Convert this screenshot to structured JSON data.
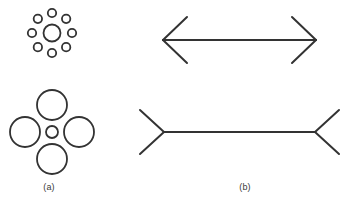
{
  "figure": {
    "width": 356,
    "height": 207,
    "background_color": "#ffffff",
    "stroke_color": "#333333",
    "caption_color": "#3a3a3a"
  },
  "panels": [
    {
      "id": "a",
      "label": "(a)",
      "illusion_name": "Ebbinghaus (Titchener circles) illusion",
      "stimuli": [
        {
          "id": "ebbinghaus-top",
          "description": "central circle surrounded by eight small circles",
          "center": {
            "x": 52,
            "y": 33
          },
          "target_circle": {
            "cx": 52,
            "cy": 33,
            "r": 8.5
          },
          "inducer_count": 8,
          "inducer_radius": 4.2,
          "inducer_ring_radius": 20,
          "inducer_start_angle_deg": -90
        },
        {
          "id": "ebbinghaus-bottom",
          "description": "central circle surrounded by four large circles",
          "center": {
            "x": 52,
            "y": 132
          },
          "target_circle": {
            "cx": 52,
            "cy": 132,
            "r": 6
          },
          "inducer_count": 4,
          "inducer_radius": 15,
          "inducer_ring_radius": 27,
          "inducer_start_angle_deg": -90
        }
      ]
    },
    {
      "id": "b",
      "label": "(b)",
      "illusion_name": "Müller-Lyer illusion",
      "stimuli": [
        {
          "id": "muller-lyer-top",
          "description": "shaft with outward-pointing arrowheads",
          "fin_direction": "outward",
          "shaft": {
            "x1": 163,
            "y1": 40,
            "x2": 316,
            "y2": 40
          },
          "fins": [
            {
              "x1": 163,
              "y1": 40,
              "x2": 187,
              "y2": 17
            },
            {
              "x1": 163,
              "y1": 40,
              "x2": 187,
              "y2": 63
            },
            {
              "x1": 316,
              "y1": 40,
              "x2": 292,
              "y2": 17
            },
            {
              "x1": 316,
              "y1": 40,
              "x2": 292,
              "y2": 63
            }
          ]
        },
        {
          "id": "muller-lyer-bottom",
          "description": "shaft with inward-pointing arrowheads",
          "fin_direction": "inward",
          "shaft": {
            "x1": 164,
            "y1": 132,
            "x2": 315,
            "y2": 132
          },
          "fins": [
            {
              "x1": 164,
              "y1": 132,
              "x2": 140,
              "y2": 110
            },
            {
              "x1": 164,
              "y1": 132,
              "x2": 140,
              "y2": 154
            },
            {
              "x1": 315,
              "y1": 132,
              "x2": 339,
              "y2": 110
            },
            {
              "x1": 315,
              "y1": 132,
              "x2": 339,
              "y2": 154
            }
          ]
        }
      ]
    }
  ]
}
